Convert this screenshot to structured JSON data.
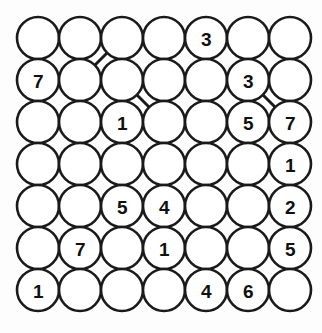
{
  "puzzle": {
    "title": "Hashi Number Grid",
    "type": "circle-node-grid",
    "rows": 7,
    "cols": 7,
    "geometry": {
      "origin_x": 38,
      "origin_y": 38,
      "spacing_x": 42,
      "spacing_y": 42,
      "radius": 21,
      "width": 322,
      "height": 333
    },
    "colors": {
      "background": "#fdfdfd",
      "node_fill": "#ffffff",
      "node_stroke": "#1a1a1a",
      "edge_stroke": "#1a1a1a",
      "label_color": "#101010"
    },
    "nodes": [
      {
        "id": "r1c1",
        "row": 1,
        "col": 1,
        "label": ""
      },
      {
        "id": "r1c2",
        "row": 1,
        "col": 2,
        "label": ""
      },
      {
        "id": "r1c3",
        "row": 1,
        "col": 3,
        "label": ""
      },
      {
        "id": "r1c4",
        "row": 1,
        "col": 4,
        "label": ""
      },
      {
        "id": "r1c5",
        "row": 1,
        "col": 5,
        "label": "3"
      },
      {
        "id": "r1c6",
        "row": 1,
        "col": 6,
        "label": ""
      },
      {
        "id": "r1c7",
        "row": 1,
        "col": 7,
        "label": ""
      },
      {
        "id": "r2c1",
        "row": 2,
        "col": 1,
        "label": "7"
      },
      {
        "id": "r2c2",
        "row": 2,
        "col": 2,
        "label": ""
      },
      {
        "id": "r2c3",
        "row": 2,
        "col": 3,
        "label": ""
      },
      {
        "id": "r2c4",
        "row": 2,
        "col": 4,
        "label": ""
      },
      {
        "id": "r2c5",
        "row": 2,
        "col": 5,
        "label": ""
      },
      {
        "id": "r2c6",
        "row": 2,
        "col": 6,
        "label": "3"
      },
      {
        "id": "r2c7",
        "row": 2,
        "col": 7,
        "label": ""
      },
      {
        "id": "r3c1",
        "row": 3,
        "col": 1,
        "label": ""
      },
      {
        "id": "r3c2",
        "row": 3,
        "col": 2,
        "label": ""
      },
      {
        "id": "r3c3",
        "row": 3,
        "col": 3,
        "label": "1"
      },
      {
        "id": "r3c4",
        "row": 3,
        "col": 4,
        "label": ""
      },
      {
        "id": "r3c5",
        "row": 3,
        "col": 5,
        "label": ""
      },
      {
        "id": "r3c6",
        "row": 3,
        "col": 6,
        "label": "5"
      },
      {
        "id": "r3c7",
        "row": 3,
        "col": 7,
        "label": "7"
      },
      {
        "id": "r4c1",
        "row": 4,
        "col": 1,
        "label": ""
      },
      {
        "id": "r4c2",
        "row": 4,
        "col": 2,
        "label": ""
      },
      {
        "id": "r4c3",
        "row": 4,
        "col": 3,
        "label": ""
      },
      {
        "id": "r4c4",
        "row": 4,
        "col": 4,
        "label": ""
      },
      {
        "id": "r4c5",
        "row": 4,
        "col": 5,
        "label": ""
      },
      {
        "id": "r4c6",
        "row": 4,
        "col": 6,
        "label": ""
      },
      {
        "id": "r4c7",
        "row": 4,
        "col": 7,
        "label": "1"
      },
      {
        "id": "r5c1",
        "row": 5,
        "col": 1,
        "label": ""
      },
      {
        "id": "r5c2",
        "row": 5,
        "col": 2,
        "label": ""
      },
      {
        "id": "r5c3",
        "row": 5,
        "col": 3,
        "label": "5"
      },
      {
        "id": "r5c4",
        "row": 5,
        "col": 4,
        "label": "4"
      },
      {
        "id": "r5c5",
        "row": 5,
        "col": 5,
        "label": ""
      },
      {
        "id": "r5c6",
        "row": 5,
        "col": 6,
        "label": ""
      },
      {
        "id": "r5c7",
        "row": 5,
        "col": 7,
        "label": "2"
      },
      {
        "id": "r6c1",
        "row": 6,
        "col": 1,
        "label": ""
      },
      {
        "id": "r6c2",
        "row": 6,
        "col": 2,
        "label": "7"
      },
      {
        "id": "r6c3",
        "row": 6,
        "col": 3,
        "label": ""
      },
      {
        "id": "r6c4",
        "row": 6,
        "col": 4,
        "label": "1"
      },
      {
        "id": "r6c5",
        "row": 6,
        "col": 5,
        "label": ""
      },
      {
        "id": "r6c6",
        "row": 6,
        "col": 6,
        "label": ""
      },
      {
        "id": "r6c7",
        "row": 6,
        "col": 7,
        "label": "5"
      },
      {
        "id": "r7c1",
        "row": 7,
        "col": 1,
        "label": "1"
      },
      {
        "id": "r7c2",
        "row": 7,
        "col": 2,
        "label": ""
      },
      {
        "id": "r7c3",
        "row": 7,
        "col": 3,
        "label": ""
      },
      {
        "id": "r7c4",
        "row": 7,
        "col": 4,
        "label": ""
      },
      {
        "id": "r7c5",
        "row": 7,
        "col": 5,
        "label": "4"
      },
      {
        "id": "r7c6",
        "row": 7,
        "col": 6,
        "label": "6"
      },
      {
        "id": "r7c7",
        "row": 7,
        "col": 7,
        "label": ""
      }
    ],
    "edges": [
      {
        "from": "r1c1",
        "to": "r1c2",
        "kind": "horizontal"
      },
      {
        "from": "r1c2",
        "to": "r1c3",
        "kind": "horizontal"
      },
      {
        "from": "r1c5",
        "to": "r1c6",
        "kind": "horizontal"
      },
      {
        "from": "r1c6",
        "to": "r1c7",
        "kind": "horizontal"
      },
      {
        "from": "r1c3",
        "to": "r2c2",
        "kind": "diagonal"
      },
      {
        "from": "r1c4",
        "to": "r2c4",
        "kind": "vertical"
      },
      {
        "from": "r1c5",
        "to": "r2c5",
        "kind": "vertical"
      },
      {
        "from": "r1c7",
        "to": "r2c7",
        "kind": "vertical"
      },
      {
        "from": "r2c1",
        "to": "r2c2",
        "kind": "horizontal"
      },
      {
        "from": "r2c4",
        "to": "r2c5",
        "kind": "horizontal"
      },
      {
        "from": "r2c1",
        "to": "r3c1",
        "kind": "vertical"
      },
      {
        "from": "r2c3",
        "to": "r3c3",
        "kind": "vertical"
      },
      {
        "from": "r2c3",
        "to": "r3c4",
        "kind": "diagonal"
      },
      {
        "from": "r2c5",
        "to": "r3c5",
        "kind": "vertical"
      },
      {
        "from": "r2c6",
        "to": "r3c6",
        "kind": "vertical"
      },
      {
        "from": "r2c6",
        "to": "r3c7",
        "kind": "diagonal"
      },
      {
        "from": "r3c2",
        "to": "r3c3",
        "kind": "horizontal"
      },
      {
        "from": "r3c4",
        "to": "r3c5",
        "kind": "horizontal"
      },
      {
        "from": "r3c1",
        "to": "r4c1",
        "kind": "vertical"
      },
      {
        "from": "r3c5",
        "to": "r4c5",
        "kind": "vertical"
      },
      {
        "from": "r3c6",
        "to": "r4c6",
        "kind": "vertical"
      },
      {
        "from": "r4c2",
        "to": "r4c3",
        "kind": "horizontal"
      },
      {
        "from": "r4c2",
        "to": "r5c2",
        "kind": "vertical"
      },
      {
        "from": "r4c3",
        "to": "r5c3",
        "kind": "vertical"
      },
      {
        "from": "r4c4",
        "to": "r5c4",
        "kind": "vertical"
      },
      {
        "from": "r4c5",
        "to": "r5c5",
        "kind": "vertical"
      },
      {
        "from": "r4c6",
        "to": "r5c6",
        "kind": "vertical"
      },
      {
        "from": "r4c7",
        "to": "r5c7",
        "kind": "vertical"
      },
      {
        "from": "r5c1",
        "to": "r5c2",
        "kind": "horizontal"
      },
      {
        "from": "r5c1",
        "to": "r6c1",
        "kind": "vertical"
      },
      {
        "from": "r5c3",
        "to": "r6c3",
        "kind": "vertical"
      },
      {
        "from": "r5c4",
        "to": "r6c4",
        "kind": "vertical"
      },
      {
        "from": "r5c6",
        "to": "r6c6",
        "kind": "vertical"
      },
      {
        "from": "r5c7",
        "to": "r6c7",
        "kind": "vertical"
      },
      {
        "from": "r6c3",
        "to": "r6c4",
        "kind": "horizontal"
      },
      {
        "from": "r6c5",
        "to": "r6c6",
        "kind": "horizontal"
      },
      {
        "from": "r6c1",
        "to": "r7c1",
        "kind": "vertical"
      },
      {
        "from": "r6c2",
        "to": "r7c2",
        "kind": "vertical"
      },
      {
        "from": "r6c3",
        "to": "r7c3",
        "kind": "vertical"
      },
      {
        "from": "r6c4",
        "to": "r7c4",
        "kind": "vertical"
      },
      {
        "from": "r6c5",
        "to": "r7c5",
        "kind": "vertical"
      },
      {
        "from": "r6c7",
        "to": "r7c7",
        "kind": "vertical"
      },
      {
        "from": "r7c2",
        "to": "r7c3",
        "kind": "horizontal"
      },
      {
        "from": "r7c4",
        "to": "r7c5",
        "kind": "horizontal"
      },
      {
        "from": "r7c5",
        "to": "r7c6",
        "kind": "horizontal"
      },
      {
        "from": "r7c6",
        "to": "r7c7",
        "kind": "horizontal"
      }
    ]
  }
}
